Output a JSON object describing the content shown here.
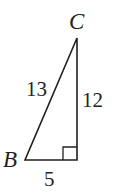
{
  "diagram": {
    "type": "right-triangle",
    "vertices": {
      "B": {
        "label": "B",
        "x": 25,
        "y": 160
      },
      "right_angle": {
        "x": 77,
        "y": 160
      },
      "C": {
        "label": "C",
        "x": 77,
        "y": 38
      }
    },
    "sides": {
      "hypotenuse": {
        "label": "13"
      },
      "vertical_leg": {
        "label": "12"
      },
      "horizontal_leg": {
        "label": "5"
      }
    },
    "colors": {
      "stroke": "#231f20",
      "background": "#ffffff"
    }
  }
}
